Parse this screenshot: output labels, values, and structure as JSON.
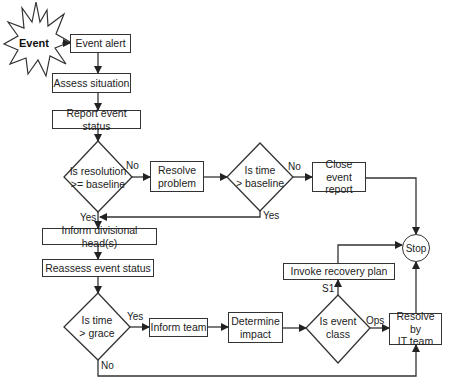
{
  "diagram": {
    "type": "flowchart",
    "start": {
      "label": "Event",
      "shape": "starburst"
    },
    "nodes": {
      "event_alert": "Event alert",
      "assess_situation": "Assess situation",
      "report_event_status": "Report event status",
      "decision_resolution": [
        "Is resolution",
        ">= baseline"
      ],
      "resolve_problem": [
        "Resolve",
        "problem"
      ],
      "decision_time_baseline": [
        "Is time",
        "> baseline"
      ],
      "close_event_report": [
        "Close event",
        "report"
      ],
      "stop": "Stop",
      "inform_divisional_heads": "Inform divisional head(s)",
      "reassess_event_status": "Reassess event status",
      "invoke_recovery_plan": "Invoke recovery plan",
      "decision_time_grace": [
        "Is time",
        "> grace"
      ],
      "inform_team": "Inform team",
      "determine_impact": [
        "Determine",
        "impact"
      ],
      "decision_event_class": [
        "Is event",
        "class"
      ],
      "resolve_by_it_team": [
        "Resolve by",
        "IT team"
      ]
    },
    "edge_labels": {
      "resolution_no": "No",
      "resolution_yes": "Yes",
      "time_baseline_no": "No",
      "time_baseline_yes": "Yes",
      "grace_yes": "Yes",
      "grace_no": "No",
      "class_s1": "S1",
      "class_ops": "Ops"
    },
    "edges": [
      [
        "Event",
        "Event alert"
      ],
      [
        "Event alert",
        "Assess situation"
      ],
      [
        "Assess situation",
        "Report event status"
      ],
      [
        "Report event status",
        "Is resolution >= baseline"
      ],
      [
        "Is resolution >= baseline",
        "Resolve problem",
        "No"
      ],
      [
        "Is resolution >= baseline",
        "Inform divisional head(s)",
        "Yes"
      ],
      [
        "Resolve problem",
        "Is time > baseline"
      ],
      [
        "Is time > baseline",
        "Close event report",
        "No"
      ],
      [
        "Is time > baseline",
        "Inform divisional head(s)",
        "Yes"
      ],
      [
        "Close event report",
        "Stop"
      ],
      [
        "Inform divisional head(s)",
        "Reassess event status"
      ],
      [
        "Reassess event status",
        "Is time > grace"
      ],
      [
        "Is time > grace",
        "Inform team",
        "Yes"
      ],
      [
        "Is time > grace",
        "Resolve by IT team",
        "No"
      ],
      [
        "Inform team",
        "Determine impact"
      ],
      [
        "Determine impact",
        "Is event class"
      ],
      [
        "Is event class",
        "Invoke recovery plan",
        "S1"
      ],
      [
        "Is event class",
        "Resolve by IT team",
        "Ops"
      ],
      [
        "Invoke recovery plan",
        "Stop"
      ],
      [
        "Resolve by IT team",
        "Stop"
      ]
    ],
    "colors": {
      "stroke": "#333333",
      "fill": "#ffffff",
      "text": "#222222"
    }
  }
}
